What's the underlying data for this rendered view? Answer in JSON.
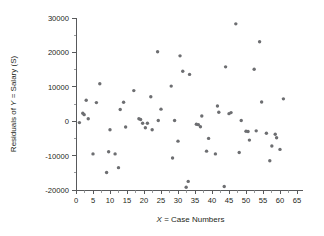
{
  "chart_data": {
    "type": "scatter",
    "title": "",
    "xlabel": "X = Case Numbers",
    "xlabel_italic_prefix": "X",
    "xlabel_rest": " = Case Numbers",
    "ylabel": "Residuals of Y = Salary (S)",
    "ylabel_prefix": "Residuals of ",
    "ylabel_italic": "Y",
    "ylabel_suffix": " = Salary (S)",
    "xlim": [
      0,
      65
    ],
    "ylim": [
      -20000,
      30000
    ],
    "xticks": [
      0,
      5,
      10,
      15,
      20,
      25,
      30,
      35,
      40,
      45,
      50,
      55,
      60,
      65
    ],
    "xtick_labels": [
      "0",
      "5",
      "10",
      "15",
      "20",
      "25",
      "30",
      "35",
      "40",
      "45",
      "50",
      "55",
      "60",
      "65"
    ],
    "yticks": [
      -20000,
      -10000,
      0,
      10000,
      20000,
      30000
    ],
    "ytick_labels": [
      "-20000",
      "-10000",
      "0",
      "10000",
      "20000",
      "30000"
    ],
    "yminor_ticks": [
      -15000,
      -5000,
      5000,
      15000,
      25000
    ],
    "grid": false,
    "legend": null,
    "marker_color": "#6d6e71",
    "marker_size": 3.4,
    "axis_color": "#58595b",
    "points": [
      {
        "x": 1,
        "y": -400
      },
      {
        "x": 2,
        "y": 2300
      },
      {
        "x": 2.4,
        "y": 1900
      },
      {
        "x": 3,
        "y": 6100
      },
      {
        "x": 3.6,
        "y": 700
      },
      {
        "x": 5,
        "y": -9500
      },
      {
        "x": 6,
        "y": 5400
      },
      {
        "x": 7,
        "y": 10900
      },
      {
        "x": 9,
        "y": -14900
      },
      {
        "x": 9.6,
        "y": -8900
      },
      {
        "x": 10,
        "y": -2500
      },
      {
        "x": 11.5,
        "y": -9500
      },
      {
        "x": 12.5,
        "y": -13500
      },
      {
        "x": 13,
        "y": 3400
      },
      {
        "x": 14,
        "y": 5500
      },
      {
        "x": 14.6,
        "y": -1700
      },
      {
        "x": 17,
        "y": 8900
      },
      {
        "x": 18.5,
        "y": 700
      },
      {
        "x": 19,
        "y": 500
      },
      {
        "x": 19.6,
        "y": -600
      },
      {
        "x": 20.4,
        "y": -1900
      },
      {
        "x": 21,
        "y": -600
      },
      {
        "x": 22,
        "y": 7100
      },
      {
        "x": 22.4,
        "y": -2500
      },
      {
        "x": 24,
        "y": 20200
      },
      {
        "x": 24.2,
        "y": 200
      },
      {
        "x": 25,
        "y": 3500
      },
      {
        "x": 28,
        "y": 10200
      },
      {
        "x": 28.4,
        "y": -10700
      },
      {
        "x": 29,
        "y": 200
      },
      {
        "x": 30,
        "y": -5800
      },
      {
        "x": 30.6,
        "y": 19000
      },
      {
        "x": 31.4,
        "y": 14500
      },
      {
        "x": 32.4,
        "y": -19200
      },
      {
        "x": 33,
        "y": -17500
      },
      {
        "x": 33.4,
        "y": 13600
      },
      {
        "x": 35.4,
        "y": -900
      },
      {
        "x": 36,
        "y": -1000
      },
      {
        "x": 36.6,
        "y": -1600
      },
      {
        "x": 37,
        "y": 1500
      },
      {
        "x": 38.4,
        "y": -8700
      },
      {
        "x": 39,
        "y": -5000
      },
      {
        "x": 41,
        "y": -9500
      },
      {
        "x": 41.6,
        "y": 4400
      },
      {
        "x": 42,
        "y": 2600
      },
      {
        "x": 43.6,
        "y": -19000
      },
      {
        "x": 44,
        "y": 15800
      },
      {
        "x": 45,
        "y": 2200
      },
      {
        "x": 45.6,
        "y": 2500
      },
      {
        "x": 47,
        "y": 28300
      },
      {
        "x": 48,
        "y": -9100
      },
      {
        "x": 48.6,
        "y": 200
      },
      {
        "x": 50,
        "y": -2900
      },
      {
        "x": 50.6,
        "y": -3000
      },
      {
        "x": 51,
        "y": -5500
      },
      {
        "x": 52.4,
        "y": 15100
      },
      {
        "x": 53,
        "y": -2800
      },
      {
        "x": 54,
        "y": 23100
      },
      {
        "x": 54.6,
        "y": 5600
      },
      {
        "x": 56,
        "y": -3500
      },
      {
        "x": 57,
        "y": -11500
      },
      {
        "x": 57.6,
        "y": -7200
      },
      {
        "x": 58.6,
        "y": -3800
      },
      {
        "x": 59,
        "y": -4800
      },
      {
        "x": 60,
        "y": -8200
      },
      {
        "x": 61,
        "y": 6500
      }
    ]
  }
}
